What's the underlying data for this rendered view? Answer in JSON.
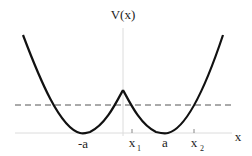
{
  "diagram": {
    "type": "double-well potential",
    "y_axis_label": "V(x)",
    "x_axis_label": "x",
    "tick_labels": {
      "neg_a": "-a",
      "x1": "x",
      "x1_sub": "1",
      "a": "a",
      "x2": "x",
      "x2_sub": "2"
    },
    "energy_level_line": "dashed horizontal line",
    "colors": {
      "curve": "#111111",
      "axis": "#d8d8d8",
      "dashed": "#555555",
      "text": "#222222"
    }
  }
}
